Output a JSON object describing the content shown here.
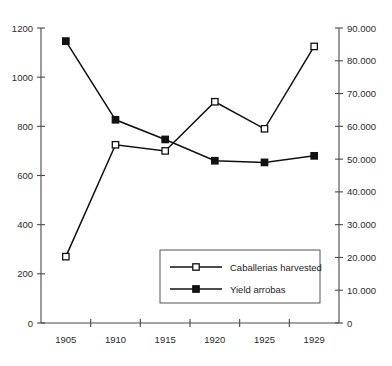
{
  "chart_data": {
    "type": "line",
    "title": "",
    "xlabel": "",
    "categories": [
      "1905",
      "1910",
      "1915",
      "1920",
      "1925",
      "1929"
    ],
    "grid": false,
    "legend_position": "inside-bottom-right",
    "series": [
      {
        "name": "Caballerias harvested",
        "axis": "left",
        "marker": "open-square",
        "values": [
          270,
          725,
          700,
          900,
          790,
          1125
        ]
      },
      {
        "name": "Yield arrobas",
        "axis": "right",
        "marker": "filled-square",
        "values": [
          86000,
          62000,
          56000,
          49500,
          49000,
          51000
        ]
      }
    ],
    "left_axis": {
      "label": "",
      "ylim": [
        0,
        1200
      ],
      "step": 200,
      "ticks": [
        "0",
        "200",
        "400",
        "600",
        "800",
        "1000",
        "1200"
      ]
    },
    "right_axis": {
      "label": "",
      "ylim": [
        0,
        90000
      ],
      "step": 10000,
      "ticks": [
        "0",
        "10.000",
        "20.000",
        "30.000",
        "40.000",
        "50.000",
        "60.000",
        "70.000",
        "80.000",
        "90.000"
      ]
    }
  },
  "legend": {
    "entries": [
      {
        "label": "Caballerias harvested",
        "marker": "open-square"
      },
      {
        "label": "Yield arrobas",
        "marker": "filled-square"
      }
    ]
  }
}
